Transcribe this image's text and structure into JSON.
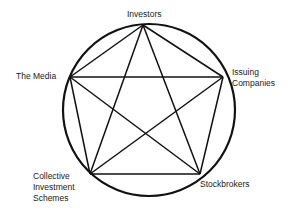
{
  "diagram": {
    "type": "pentagram-in-circle",
    "stroke_color": "#111111",
    "circle": {
      "cx": 149,
      "cy": 110,
      "r": 86
    },
    "nodes": [
      {
        "id": "investors",
        "lines": [
          "Investors"
        ],
        "x": 143,
        "y": 25
      },
      {
        "id": "issuing-companies",
        "lines": [
          "Issuing",
          "Companies"
        ],
        "x": 223,
        "y": 77
      },
      {
        "id": "stockbrokers",
        "lines": [
          "Stockbrokers"
        ],
        "x": 200,
        "y": 174
      },
      {
        "id": "collective-investment-schemes",
        "lines": [
          "Collective",
          "Investment",
          "Schemes"
        ],
        "x": 90,
        "y": 174
      },
      {
        "id": "the-media",
        "lines": [
          "The Media"
        ],
        "x": 70,
        "y": 77
      }
    ]
  }
}
